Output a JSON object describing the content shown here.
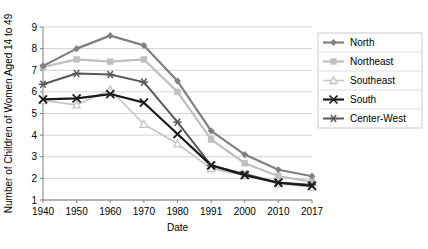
{
  "chart_data": {
    "type": "line",
    "title": "",
    "xlabel": "Date",
    "ylabel": "Number of Women Aged 14 to 49",
    "ylabel_full": "Number of Children of Women Aged 14 to 49",
    "categories": [
      "1940",
      "1950",
      "1960",
      "1970",
      "1980",
      "1991",
      "2000",
      "2010",
      "2017"
    ],
    "ylim": [
      1,
      9
    ],
    "yticks": [
      1,
      2,
      3,
      4,
      5,
      6,
      7,
      8,
      9
    ],
    "grid": true,
    "legend_position": "right",
    "series": [
      {
        "name": "North",
        "color": "#808080",
        "marker": "diamond",
        "width": 2.2,
        "values": [
          7.2,
          8.0,
          8.6,
          8.15,
          6.5,
          4.2,
          3.1,
          2.4,
          2.1
        ]
      },
      {
        "name": "Northeast",
        "color": "#bfbfbf",
        "marker": "square",
        "width": 2.2,
        "values": [
          7.15,
          7.5,
          7.4,
          7.5,
          6.0,
          3.8,
          2.7,
          2.1,
          1.85
        ]
      },
      {
        "name": "Southeast",
        "color": "#c4c4c4",
        "marker": "triangle",
        "width": 1.6,
        "values": [
          5.6,
          5.4,
          6.1,
          4.5,
          3.6,
          2.45,
          2.15,
          1.75,
          1.6
        ]
      },
      {
        "name": "South",
        "color": "#1a1a1a",
        "marker": "cross",
        "width": 2.2,
        "values": [
          5.65,
          5.7,
          5.9,
          5.5,
          4.05,
          2.6,
          2.15,
          1.8,
          1.65
        ]
      },
      {
        "name": "Center-West",
        "color": "#595959",
        "marker": "star",
        "width": 2.0,
        "values": [
          6.35,
          6.85,
          6.8,
          6.45,
          4.6,
          2.6,
          2.2,
          1.8,
          1.7
        ]
      }
    ]
  },
  "legend": {
    "items": [
      {
        "label": "North"
      },
      {
        "label": "Northeast"
      },
      {
        "label": "Southeast"
      },
      {
        "label": "South"
      },
      {
        "label": "Center-West"
      }
    ]
  }
}
